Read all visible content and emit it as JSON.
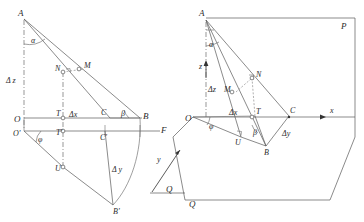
{
  "figure": {
    "background_color": "#ffffff",
    "line_color": "#595959",
    "label_color": "#2b2b2b"
  },
  "left_panel": {
    "name": "orthographic-projection-panel",
    "points": [
      {
        "id": "A",
        "label": "A",
        "x": 24,
        "y": 17
      },
      {
        "id": "N",
        "label": "N",
        "x": 63,
        "y": 72
      },
      {
        "id": "M",
        "label": "M",
        "x": 84,
        "y": 68
      },
      {
        "id": "O",
        "label": "O",
        "x": 24,
        "y": 118
      },
      {
        "id": "T",
        "label": "T",
        "x": 63,
        "y": 118
      },
      {
        "id": "C",
        "label": "C",
        "x": 105,
        "y": 118
      },
      {
        "id": "B",
        "label": "B",
        "x": 140,
        "y": 118
      },
      {
        "id": "Op",
        "label": "O'",
        "x": 24,
        "y": 131
      },
      {
        "id": "Tp",
        "label": "T'",
        "x": 63,
        "y": 131
      },
      {
        "id": "Cp",
        "label": "C'",
        "x": 105,
        "y": 131
      },
      {
        "id": "F",
        "label": "F",
        "x": 160,
        "y": 131
      },
      {
        "id": "U",
        "label": "U",
        "x": 63,
        "y": 167
      },
      {
        "id": "Bp",
        "label": "B'",
        "x": 113,
        "y": 207
      }
    ],
    "angle_labels": [
      {
        "id": "alpha",
        "label": "α",
        "x": 33,
        "y": 42
      },
      {
        "id": "beta",
        "label": "β",
        "x": 118,
        "y": 112
      },
      {
        "id": "phi",
        "label": "φ",
        "x": 39,
        "y": 141
      }
    ],
    "dimension_labels": [
      {
        "id": "delta-z",
        "label": "Δ z",
        "x": 9,
        "y": 80
      },
      {
        "id": "delta-x",
        "label": "Δx",
        "x": 74,
        "y": 116
      },
      {
        "id": "delta-y",
        "label": "Δ y",
        "x": 118,
        "y": 170
      }
    ],
    "axis_labels": [
      {
        "id": "y-axis",
        "label": "y",
        "x": 155,
        "y": 160
      },
      {
        "id": "q-plane",
        "label": "Q",
        "x": 170,
        "y": 193
      }
    ]
  },
  "right_panel": {
    "name": "axonometric-projection-panel",
    "points": [
      {
        "id": "A",
        "label": "A",
        "x": 206,
        "y": 16
      },
      {
        "id": "P",
        "label": "P",
        "x": 345,
        "y": 26
      },
      {
        "id": "N",
        "label": "N",
        "x": 255,
        "y": 75
      },
      {
        "id": "M",
        "label": "M",
        "x": 235,
        "y": 90
      },
      {
        "id": "O",
        "label": "O",
        "x": 193,
        "y": 117
      },
      {
        "id": "T",
        "label": "T",
        "x": 258,
        "y": 115
      },
      {
        "id": "C",
        "label": "C",
        "x": 291,
        "y": 113
      },
      {
        "id": "U",
        "label": "U",
        "x": 240,
        "y": 140
      },
      {
        "id": "B",
        "label": "B",
        "x": 266,
        "y": 148
      },
      {
        "id": "Q",
        "label": "Q",
        "x": 193,
        "y": 205
      }
    ],
    "angle_labels": [
      {
        "id": "alpha",
        "label": "α",
        "x": 211,
        "y": 46
      },
      {
        "id": "beta",
        "label": "β",
        "x": 255,
        "y": 135
      },
      {
        "id": "phi",
        "label": "φ",
        "x": 211,
        "y": 127
      }
    ],
    "dimension_labels": [
      {
        "id": "delta-z",
        "label": "Δz",
        "x": 211,
        "y": 90
      },
      {
        "id": "delta-x",
        "label": "Δx",
        "x": 235,
        "y": 113
      },
      {
        "id": "delta-y",
        "label": "Δy",
        "x": 288,
        "y": 133
      }
    ],
    "axis_labels": [
      {
        "id": "x-axis",
        "label": "x",
        "x": 330,
        "y": 112
      },
      {
        "id": "z-axis",
        "label": "z",
        "x": 202,
        "y": 66
      }
    ]
  }
}
